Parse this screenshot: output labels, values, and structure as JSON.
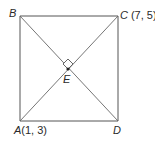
{
  "diagram": {
    "type": "geometry",
    "shape": "square",
    "vertices": [
      {
        "name": "A",
        "coords_label": "(1, 3)"
      },
      {
        "name": "B",
        "coords_label": ""
      },
      {
        "name": "C",
        "coords_label": "(7, 5)"
      },
      {
        "name": "D",
        "coords_label": ""
      }
    ],
    "intersection_point": "E",
    "right_angle_at": "E",
    "segments": [
      "AB",
      "BC",
      "CD",
      "DA",
      "AC",
      "BD"
    ]
  },
  "labels": {
    "A": "A",
    "A_coords": "(1, 3)",
    "B": "B",
    "C": "C",
    "C_coords": "(7, 5)",
    "D": "D",
    "E": "E"
  }
}
